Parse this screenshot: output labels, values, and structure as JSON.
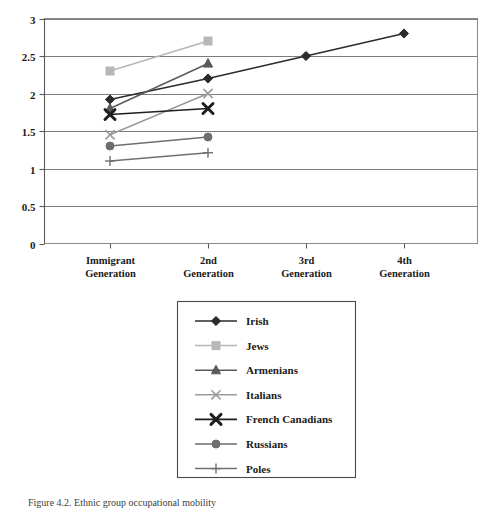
{
  "chart_data": {
    "type": "line",
    "title": "",
    "subtitle": "",
    "xlabel": "",
    "ylabel": "",
    "categories": [
      "Immigrant Generation",
      "2nd Generation",
      "3rd Generation",
      "4th Generation"
    ],
    "xtick_lines": [
      [
        "Immigrant",
        "Generation"
      ],
      [
        "2nd",
        "Generation"
      ],
      [
        "3rd",
        "Generation"
      ],
      [
        "4th",
        "Generation"
      ]
    ],
    "ylim": [
      0,
      3
    ],
    "yticks": [
      0,
      0.5,
      1,
      1.5,
      2,
      2.5,
      3
    ],
    "ytick_labels": [
      "0",
      "0.5",
      "1",
      "1.5",
      "2",
      "2.5",
      "3"
    ],
    "grid": true,
    "grid_axis": "y",
    "legend_position": "bottom-center",
    "series": [
      {
        "name": "Irish",
        "marker": "diamond",
        "color": "#2b2b2b",
        "values": [
          1.92,
          2.2,
          2.5,
          2.8
        ]
      },
      {
        "name": "Jews",
        "marker": "square",
        "color": "#b7b7b7",
        "values": [
          2.3,
          2.7,
          null,
          null
        ]
      },
      {
        "name": "Armenians",
        "marker": "triangle",
        "color": "#5a5a5a",
        "values": [
          1.8,
          2.4,
          null,
          null
        ]
      },
      {
        "name": "Italians",
        "marker": "x-thin",
        "color": "#9a9a9a",
        "values": [
          1.45,
          2.0,
          null,
          null
        ]
      },
      {
        "name": "French Canadians",
        "marker": "x-bold",
        "color": "#1f1f1f",
        "values": [
          1.72,
          1.8,
          null,
          null
        ]
      },
      {
        "name": "Russians",
        "marker": "circle",
        "color": "#6e6e6e",
        "values": [
          1.3,
          1.42,
          null,
          null
        ]
      },
      {
        "name": "Poles",
        "marker": "plus",
        "color": "#707070",
        "values": [
          1.1,
          1.21,
          null,
          null
        ]
      }
    ]
  },
  "legend": {
    "entries": [
      "Irish",
      "Jews",
      "Armenians",
      "Italians",
      "French Canadians",
      "Russians",
      "Poles"
    ]
  },
  "caption": {
    "text": "Figure 4.2.  Ethnic group occupational mobility"
  }
}
